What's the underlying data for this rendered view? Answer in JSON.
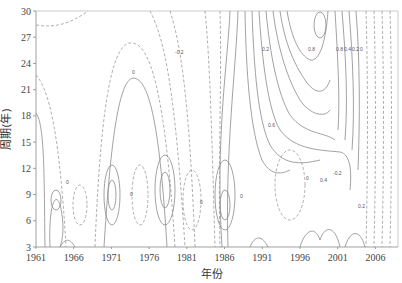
{
  "chart_data": {
    "type": "heatmap",
    "subtype": "contour",
    "title": "",
    "xlabel": "年份",
    "ylabel": "周期(年)",
    "x_ticks": [
      "1961",
      "1966",
      "1971",
      "1976",
      "1981",
      "1986",
      "1991",
      "1996",
      "2001",
      "2006"
    ],
    "y_ticks": [
      "3",
      "6",
      "9",
      "12",
      "15",
      "18",
      "21",
      "24",
      "27",
      "30"
    ],
    "xlim": [
      1961,
      2009
    ],
    "ylim": [
      3,
      30
    ],
    "grid": false,
    "legend": null,
    "line_styles": {
      "positive": "solid",
      "negative": "dashed"
    },
    "contour_levels": [
      -0.6,
      -0.4,
      -0.2,
      0,
      0.2,
      0.4,
      0.6,
      0.8
    ],
    "contour_labels": [
      {
        "text": "0",
        "x": 1973.5,
        "y": 23
      },
      {
        "text": "-0.2",
        "x": 1984.5,
        "y": 25.5
      },
      {
        "text": "0",
        "x": 1988.5,
        "y": 21
      },
      {
        "text": "0.2",
        "x": 1994.5,
        "y": 22.5
      },
      {
        "text": "0.6",
        "x": 1997.5,
        "y": 17
      },
      {
        "text": "0.8",
        "x": 1998,
        "y": 24.5
      },
      {
        "text": "0.8",
        "x": 2003,
        "y": 25.5
      },
      {
        "text": "0.4",
        "x": 2004.5,
        "y": 25.5
      },
      {
        "text": "0.2",
        "x": 2006.5,
        "y": 25.5
      },
      {
        "text": "0",
        "x": 2008,
        "y": 25.5
      },
      {
        "text": "0.4",
        "x": 1999.5,
        "y": 11.5
      },
      {
        "text": "0.2",
        "x": 2004,
        "y": 8
      },
      {
        "text": "-0.2",
        "x": 1997,
        "y": 10.5
      },
      {
        "text": "0",
        "x": 1994,
        "y": 11
      },
      {
        "text": "0",
        "x": 1965.5,
        "y": 10
      },
      {
        "text": "0",
        "x": 1975,
        "y": 9
      },
      {
        "text": "0",
        "x": 1985,
        "y": 8
      },
      {
        "text": "0",
        "x": 1990,
        "y": 9
      }
    ]
  },
  "page": {
    "top_cut_text": ""
  }
}
